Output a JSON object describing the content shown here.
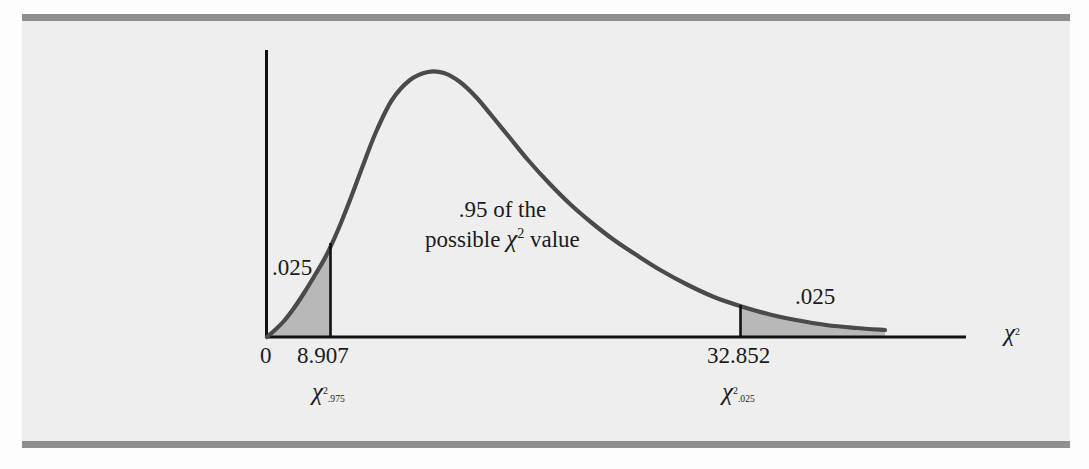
{
  "figure": {
    "background_color": "#eeeeee",
    "rule_color": "#8e8e8e",
    "curve_color": "#4a4a4a",
    "shade_color": "#b8b8b8",
    "axis_color": "#111111"
  },
  "axis": {
    "x_axis_label": "χ",
    "x_axis_exponent": "2",
    "origin_label": "0"
  },
  "labels": {
    "left_tail_area": ".025",
    "right_tail_area": ".025",
    "center_line1": ".95 of the",
    "center_line2_prefix": "possible",
    "center_line2_chi": "χ",
    "center_line2_exponent": "2",
    "center_line2_suffix": "value",
    "crit_left_value": "8.907",
    "crit_right_value": "32.852",
    "crit_left_symbol": "χ",
    "crit_left_exponent": "2",
    "crit_left_subscript": ".975",
    "crit_right_symbol": "χ",
    "crit_right_exponent": "2",
    "crit_right_subscript": ".025"
  },
  "chart_data": {
    "type": "line",
    "title": "",
    "xlabel": "χ²",
    "ylabel": "",
    "distribution": "chi-square",
    "grid": false,
    "legend": false,
    "annotations": [
      {
        "text": ".025",
        "region": "left-tail",
        "area": 0.025
      },
      {
        "text": ".95 of the possible χ² value",
        "region": "center",
        "area": 0.95
      },
      {
        "text": ".025",
        "region": "right-tail",
        "area": 0.025
      }
    ],
    "critical_values": [
      {
        "label": "χ².975",
        "value": 8.907,
        "tail_area": 0.025,
        "tail": "left"
      },
      {
        "label": "χ².025",
        "value": 32.852,
        "tail_area": 0.025,
        "tail": "right"
      }
    ],
    "tick_labels": [
      "0",
      "8.907",
      "32.852"
    ],
    "shaded_regions": [
      {
        "from": 0,
        "to": 8.907,
        "area": 0.025
      },
      {
        "from": 32.852,
        "to": null,
        "area": 0.025
      }
    ],
    "curve_points_px": [
      [
        267,
        337
      ],
      [
        275,
        330
      ],
      [
        284,
        321
      ],
      [
        294,
        308
      ],
      [
        304,
        293
      ],
      [
        315,
        275
      ],
      [
        326,
        256
      ],
      [
        338,
        230
      ],
      [
        350,
        200
      ],
      [
        362,
        168
      ],
      [
        376,
        132
      ],
      [
        392,
        100
      ],
      [
        410,
        80
      ],
      [
        428,
        72
      ],
      [
        444,
        73
      ],
      [
        460,
        82
      ],
      [
        476,
        97
      ],
      [
        492,
        116
      ],
      [
        510,
        138
      ],
      [
        528,
        160
      ],
      [
        548,
        182
      ],
      [
        570,
        204
      ],
      [
        592,
        223
      ],
      [
        614,
        240
      ],
      [
        638,
        256
      ],
      [
        662,
        271
      ],
      [
        688,
        285
      ],
      [
        714,
        297
      ],
      [
        740,
        306
      ],
      [
        768,
        314
      ],
      [
        796,
        320
      ],
      [
        826,
        325
      ],
      [
        856,
        328
      ],
      [
        885,
        330
      ]
    ]
  }
}
